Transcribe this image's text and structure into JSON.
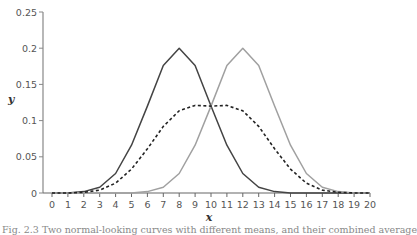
{
  "chart_data": {
    "type": "line",
    "title": "",
    "xlabel": "x",
    "ylabel": "y",
    "xlim": [
      0,
      20
    ],
    "ylim": [
      0,
      0.25
    ],
    "grid": false,
    "legend": null,
    "x": [
      0,
      1,
      2,
      3,
      4,
      5,
      6,
      7,
      8,
      9,
      10,
      11,
      12,
      13,
      14,
      15,
      16,
      17,
      18,
      19,
      20
    ],
    "x_tick_labels": [
      "0",
      "1",
      "2",
      "3",
      "4",
      "5",
      "6",
      "7",
      "8",
      "9",
      "10",
      "11",
      "12",
      "13",
      "14",
      "15",
      "16",
      "17",
      "18",
      "19",
      "20"
    ],
    "y_tick_labels": [
      "0",
      "0.05",
      "0.1",
      "0.15",
      "0.2",
      "0.25"
    ],
    "y_ticks": [
      0,
      0.05,
      0.1,
      0.15,
      0.2,
      0.25
    ],
    "series": [
      {
        "name": "dark-solid",
        "style": "solid",
        "color": "#444444",
        "values": [
          0.0,
          0.0,
          0.002,
          0.008,
          0.027,
          0.066,
          0.12,
          0.176,
          0.2,
          0.176,
          0.12,
          0.066,
          0.027,
          0.008,
          0.002,
          0.0,
          0.0,
          0.0,
          0.0,
          0.0,
          0.0
        ]
      },
      {
        "name": "light-solid",
        "style": "solid",
        "color": "#a0a0a0",
        "values": [
          0.0,
          0.0,
          0.0,
          0.0,
          0.0,
          0.0,
          0.002,
          0.008,
          0.027,
          0.066,
          0.12,
          0.176,
          0.2,
          0.176,
          0.12,
          0.066,
          0.027,
          0.008,
          0.002,
          0.0,
          0.0
        ]
      },
      {
        "name": "dashed-mixture",
        "style": "dashed",
        "color": "#222222",
        "values": [
          0.0,
          0.0,
          0.001,
          0.004,
          0.0135,
          0.033,
          0.061,
          0.092,
          0.1135,
          0.121,
          0.12,
          0.121,
          0.1135,
          0.092,
          0.061,
          0.033,
          0.0135,
          0.004,
          0.001,
          0.0,
          0.0
        ]
      }
    ]
  },
  "caption": "Fig. 2.3  Two normal-looking curves with different means, and their combined average"
}
